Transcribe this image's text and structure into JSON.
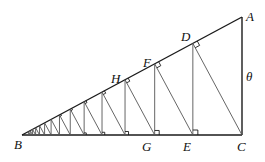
{
  "diagram": {
    "vertices": {
      "A": {
        "x": 242,
        "y": 17
      },
      "B": {
        "x": 22,
        "y": 135
      },
      "C": {
        "x": 242,
        "y": 135
      }
    },
    "iterations": 14,
    "labels": [
      {
        "id": "A",
        "text": "A",
        "x": 246,
        "y": 10
      },
      {
        "id": "B",
        "text": "B",
        "x": 14,
        "y": 138
      },
      {
        "id": "C",
        "text": "C",
        "x": 237,
        "y": 140
      },
      {
        "id": "D",
        "text": "D",
        "x": 181,
        "y": 30
      },
      {
        "id": "E",
        "text": "E",
        "x": 183,
        "y": 140
      },
      {
        "id": "F",
        "text": "F",
        "x": 143,
        "y": 56
      },
      {
        "id": "G",
        "text": "G",
        "x": 142,
        "y": 140
      },
      {
        "id": "H",
        "text": "H",
        "x": 111,
        "y": 72
      },
      {
        "id": "theta",
        "text": "θ",
        "x": 246,
        "y": 70
      }
    ],
    "colors": {
      "stroke": "#1a1a1a",
      "perp": "#555555"
    }
  }
}
